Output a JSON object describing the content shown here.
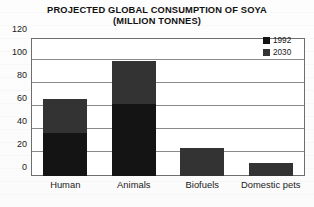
{
  "chart_data": {
    "type": "bar",
    "subtype": "stacked-bar",
    "title": "PROJECTED GLOBAL CONSUMPTION OF SOYA",
    "subtitle": "(MILLION TONNES)",
    "xlabel": "",
    "ylabel": "",
    "units": "million tonnes",
    "categories": [
      "Human",
      "Animals",
      "Biofuels",
      "Domestic pets"
    ],
    "series": [
      {
        "name": "1992",
        "color": "#141414",
        "values": [
          37,
          63,
          0,
          0
        ]
      },
      {
        "name": "2030",
        "color": "#333333",
        "values": [
          30,
          37,
          24,
          11
        ]
      }
    ],
    "totals": [
      67,
      100,
      24,
      11
    ],
    "ylim": [
      0,
      120
    ],
    "yticks": [
      0,
      20,
      40,
      60,
      80,
      100,
      120
    ],
    "ytick_labels": [
      "0",
      "20",
      "40",
      "60",
      "80",
      "100",
      "120"
    ],
    "grid": true,
    "grid_axis": "y",
    "legend_position": "top-right",
    "legend_entries": [
      "1992",
      "2030"
    ]
  },
  "colors": {
    "series_1992": "#141414",
    "series_2030": "#333333",
    "gridline": "#8a8a8a",
    "frame": "#6e6e6e",
    "text": "#1a1a1a",
    "background": "#ffffff"
  }
}
